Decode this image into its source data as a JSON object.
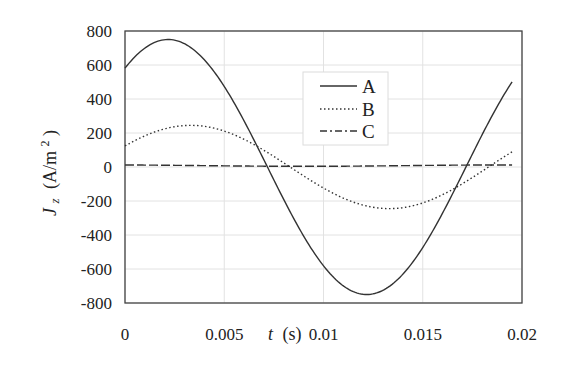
{
  "chart_data": {
    "type": "line",
    "title": "",
    "xlabel": "t (s)",
    "ylabel": "Jz (A/m2)",
    "xlim": [
      0,
      0.02
    ],
    "ylim": [
      -800,
      800
    ],
    "grid": true,
    "legend_position": "inside-top-center",
    "x_ticks": [
      "0",
      "0.005",
      "0.01",
      "0.015",
      "0.02"
    ],
    "y_ticks": [
      "800",
      "600",
      "400",
      "200",
      "0",
      "-200",
      "-400",
      "-600",
      "-800"
    ],
    "x": [
      0,
      0.001,
      0.002,
      0.003,
      0.004,
      0.005,
      0.006,
      0.007,
      0.008,
      0.009,
      0.01,
      0.011,
      0.012,
      0.013,
      0.014,
      0.015,
      0.016,
      0.017,
      0.018,
      0.019,
      0.0195
    ],
    "series": [
      {
        "name": "A",
        "style": "solid",
        "values": [
          580,
          714,
          748,
          674,
          510,
          290,
          49,
          -177,
          -391,
          -605,
          -580,
          -714,
          -748,
          -674,
          -510,
          -290,
          -49,
          177,
          391,
          605,
          500
        ]
      },
      {
        "name": "B",
        "style": "dotted",
        "values": [
          124,
          190,
          233,
          250,
          237,
          195,
          131,
          54,
          -27,
          -102,
          -124,
          -190,
          -233,
          -245,
          -237,
          -195,
          -131,
          -54,
          27,
          60,
          76
        ]
      },
      {
        "name": "C",
        "style": "dash-dot",
        "values": [
          10,
          10,
          9,
          8,
          7,
          5,
          4,
          3,
          3,
          3,
          4,
          5,
          6,
          8,
          9,
          10,
          11,
          12,
          12,
          12,
          12
        ]
      }
    ]
  },
  "labels": {
    "x_axis_t": "t",
    "x_axis_unit": "(s)",
    "y_axis_J": "J",
    "y_axis_sub": "z",
    "y_axis_unit": "(A/m",
    "y_axis_sup": "2",
    "y_axis_close": ")"
  },
  "legend": [
    "A",
    "B",
    "C"
  ],
  "colors": {
    "line": "#333333",
    "grid": "#e2e2e2",
    "frame": "#444444"
  }
}
